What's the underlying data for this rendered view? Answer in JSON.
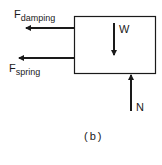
{
  "diagram": {
    "forces": {
      "damping": {
        "symbol": "F",
        "subscript": "damping"
      },
      "spring": {
        "symbol": "F",
        "subscript": "spring"
      },
      "weight": "W",
      "normal": "N"
    },
    "caption": "(b)"
  }
}
